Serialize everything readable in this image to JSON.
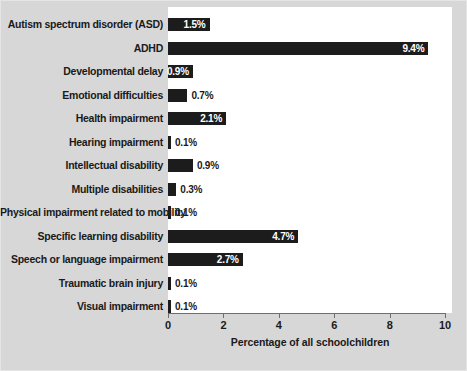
{
  "chart_data": {
    "type": "bar",
    "orientation": "horizontal",
    "title": "",
    "xlabel": "Percentage of all schoolchildren",
    "ylabel": "",
    "xlim": [
      0,
      10
    ],
    "xticks": [
      "0",
      "2",
      "4",
      "6",
      "8",
      "10"
    ],
    "grid": false,
    "legend": "none",
    "bar_color": "#1c1c1c",
    "panel_color": "#ffffff",
    "background_color": "#d7d7d7",
    "categories": [
      "Autism spectrum disorder (ASD)",
      "ADHD",
      "Developmental delay",
      "Emotional difficulties",
      "Health impairment",
      "Hearing impairment",
      "Intellectual disability",
      "Multiple disabilities",
      "Physical impairment related to mobility",
      "Specific learning disability",
      "Speech or language impairment",
      "Traumatic brain injury",
      "Visual impairment"
    ],
    "values": [
      1.5,
      9.4,
      0.9,
      0.7,
      2.1,
      0.1,
      0.9,
      0.3,
      0.1,
      4.7,
      2.7,
      0.1,
      0.1
    ],
    "value_labels": [
      "1.5%",
      "9.4%",
      "0.9%",
      "0.7%",
      "2.1%",
      "0.1%",
      "0.9%",
      "0.3%",
      "0.1%",
      "4.7%",
      "2.7%",
      "0.1%",
      "0.1%"
    ],
    "label_placement": [
      "inside",
      "inside",
      "inside",
      "outside",
      "inside",
      "outside",
      "outside",
      "outside",
      "outside",
      "inside",
      "inside",
      "outside",
      "outside"
    ]
  }
}
